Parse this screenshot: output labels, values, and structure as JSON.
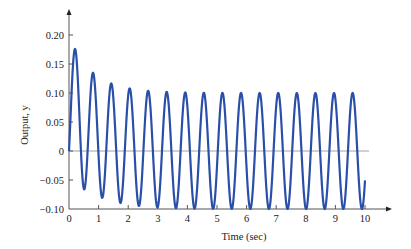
{
  "chart_data": {
    "type": "line",
    "title": "",
    "xlabel": "Time (sec)",
    "ylabel": "Output, y",
    "xlim": [
      0,
      10
    ],
    "ylim": [
      -0.1,
      0.22
    ],
    "x_ticks": [
      0,
      1,
      2,
      3,
      4,
      5,
      6,
      7,
      8,
      9,
      10
    ],
    "x_tick_labels": [
      "0",
      "1",
      "2",
      "3",
      "4",
      "5",
      "6",
      "7",
      "8",
      "9",
      "10"
    ],
    "y_ticks": [
      -0.1,
      -0.05,
      0,
      0.05,
      0.1,
      0.15,
      0.2
    ],
    "y_tick_labels": [
      "−0.10",
      "−0.05",
      "0",
      "0.05",
      "0.10",
      "0.15",
      "0.20"
    ],
    "grid": false,
    "legend": null,
    "series": [
      {
        "name": "Output, y",
        "color": "#2a4fa8",
        "model": {
          "description": "y(t) = A*sin(w*t) + B*exp(-t/tau)*(1 - cos(w*t))",
          "A": 0.1,
          "B": 0.075,
          "tau": 0.9,
          "w": 10.0
        },
        "peaks": [
          {
            "t": 0.3,
            "y": 0.17
          },
          {
            "t": 0.95,
            "y": 0.137
          },
          {
            "t": 1.6,
            "y": 0.12
          },
          {
            "t": 2.2,
            "y": 0.112
          },
          {
            "t": 2.85,
            "y": 0.107
          },
          {
            "t": 3.5,
            "y": 0.104
          },
          {
            "t": 4.1,
            "y": 0.102
          },
          {
            "t": 4.75,
            "y": 0.101
          },
          {
            "t": 5.4,
            "y": 0.1
          },
          {
            "t": 6.0,
            "y": 0.1
          },
          {
            "t": 6.65,
            "y": 0.1
          },
          {
            "t": 7.3,
            "y": 0.1
          },
          {
            "t": 7.9,
            "y": 0.1
          },
          {
            "t": 8.55,
            "y": 0.1
          },
          {
            "t": 9.2,
            "y": 0.1
          }
        ],
        "troughs": [
          {
            "t": 0.65,
            "y": -0.047
          },
          {
            "t": 1.27,
            "y": -0.072
          },
          {
            "t": 1.9,
            "y": -0.086
          },
          {
            "t": 2.5,
            "y": -0.094
          },
          {
            "t": 3.15,
            "y": -0.097
          },
          {
            "t": 3.8,
            "y": -0.099
          },
          {
            "t": 4.4,
            "y": -0.1
          },
          {
            "t": 5.05,
            "y": -0.1
          },
          {
            "t": 5.7,
            "y": -0.1
          },
          {
            "t": 6.3,
            "y": -0.1
          },
          {
            "t": 6.95,
            "y": -0.1
          },
          {
            "t": 7.55,
            "y": -0.1
          },
          {
            "t": 8.2,
            "y": -0.1
          },
          {
            "t": 8.85,
            "y": -0.1
          },
          {
            "t": 9.45,
            "y": -0.1
          }
        ],
        "end_point": {
          "t": 10.0,
          "y": -0.06
        }
      }
    ],
    "reference_lines": [
      {
        "axis": "y",
        "value": 0,
        "color": "#8a8a8a"
      }
    ]
  },
  "layout": {
    "origin_x_px": 69,
    "px_per_sec": 29.6,
    "zero_y_px": 151,
    "px_per_unit_y": 580,
    "x_axis_y_px": 209,
    "y_axis_top_px": 9,
    "x_axis_right_px": 392
  }
}
